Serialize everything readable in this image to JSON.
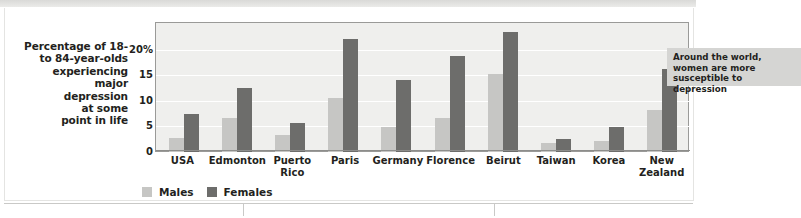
{
  "chart_data": {
    "type": "bar",
    "title": "",
    "xlabel": "",
    "ylabel": "Percentage of 18- to 84-year-olds experiencing major depression at some point in life",
    "ylim": [
      0,
      25
    ],
    "ytick_labels": [
      "20%",
      "15",
      "10",
      "5",
      "0"
    ],
    "ytick_values": [
      20,
      15,
      10,
      5,
      0
    ],
    "grid": true,
    "legend_position": "bottom-left",
    "categories": [
      "USA",
      "Edmonton",
      "Puerto Rico",
      "Paris",
      "Germany",
      "Florence",
      "Beirut",
      "Taiwan",
      "Korea",
      "New Zealand"
    ],
    "series": [
      {
        "name": "Males",
        "color": "#c6c6c4",
        "values": [
          2.8,
          6.6,
          3.3,
          10.6,
          4.8,
          6.6,
          15.3,
          1.7,
          2.2,
          8.2
        ]
      },
      {
        "name": "Females",
        "color": "#6d6d6b",
        "values": [
          7.5,
          12.5,
          5.7,
          22.0,
          14.0,
          18.8,
          23.5,
          2.5,
          4.8,
          16.2
        ]
      }
    ],
    "annotations": [
      {
        "text": "Around the world, women are more susceptible to depression"
      }
    ]
  },
  "axis_title": {
    "lines": [
      "Percentage of 18-",
      "to 84-year-olds",
      "experiencing",
      "major",
      "depression",
      "at some",
      "point in life"
    ]
  },
  "callout": {
    "text": "Around the world, women are more susceptible to depression"
  },
  "legend": {
    "males_label": "Males",
    "females_label": "Females"
  },
  "colors": {
    "male": "#c6c6c4",
    "female": "#6d6d6b",
    "plot_bg": "#efefed",
    "callout_bg": "#d5d5d3"
  }
}
